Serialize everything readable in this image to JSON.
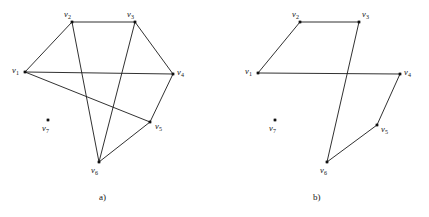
{
  "figure": {
    "background_color": "#ffffff",
    "ink_color": "#1a1a1a",
    "width": 429,
    "height": 217,
    "panels": [
      {
        "id": "panel-a",
        "caption": "a)",
        "caption_x": 99,
        "caption_y": 192,
        "vertices": [
          {
            "id": "v1",
            "label": "v",
            "sub": "1",
            "x": 25,
            "y": 72,
            "label_x": 12,
            "label_y": 66,
            "isolated": false
          },
          {
            "id": "v2",
            "label": "v",
            "sub": "2",
            "x": 72,
            "y": 22,
            "label_x": 64,
            "label_y": 10,
            "isolated": false
          },
          {
            "id": "v3",
            "label": "v",
            "sub": "3",
            "x": 135,
            "y": 22,
            "label_x": 127,
            "label_y": 10,
            "isolated": false
          },
          {
            "id": "v4",
            "label": "v",
            "sub": "4",
            "x": 173,
            "y": 74,
            "label_x": 177,
            "label_y": 68,
            "isolated": false
          },
          {
            "id": "v5",
            "label": "v",
            "sub": "5",
            "x": 150,
            "y": 122,
            "label_x": 155,
            "label_y": 122,
            "isolated": false
          },
          {
            "id": "v6",
            "label": "v",
            "sub": "6",
            "x": 99,
            "y": 162,
            "label_x": 91,
            "label_y": 166,
            "isolated": false
          },
          {
            "id": "v7",
            "label": "v",
            "sub": "7",
            "x": 48,
            "y": 120,
            "label_x": 42,
            "label_y": 124,
            "isolated": true
          }
        ],
        "edges": [
          [
            "v1",
            "v2"
          ],
          [
            "v1",
            "v4"
          ],
          [
            "v1",
            "v5"
          ],
          [
            "v2",
            "v3"
          ],
          [
            "v2",
            "v6"
          ],
          [
            "v3",
            "v4"
          ],
          [
            "v3",
            "v6"
          ],
          [
            "v4",
            "v5"
          ],
          [
            "v5",
            "v6"
          ]
        ]
      },
      {
        "id": "panel-b",
        "caption": "b)",
        "caption_x": 313,
        "caption_y": 192,
        "vertices": [
          {
            "id": "v1",
            "label": "v",
            "sub": "1",
            "x": 258,
            "y": 73,
            "label_x": 245,
            "label_y": 67,
            "isolated": false
          },
          {
            "id": "v2",
            "label": "v",
            "sub": "2",
            "x": 300,
            "y": 22,
            "label_x": 292,
            "label_y": 10,
            "isolated": false
          },
          {
            "id": "v3",
            "label": "v",
            "sub": "3",
            "x": 359,
            "y": 22,
            "label_x": 362,
            "label_y": 10,
            "isolated": false
          },
          {
            "id": "v4",
            "label": "v",
            "sub": "4",
            "x": 400,
            "y": 74,
            "label_x": 404,
            "label_y": 68,
            "isolated": false
          },
          {
            "id": "v5",
            "label": "v",
            "sub": "5",
            "x": 377,
            "y": 125,
            "label_x": 381,
            "label_y": 125,
            "isolated": false
          },
          {
            "id": "v6",
            "label": "v",
            "sub": "6",
            "x": 327,
            "y": 162,
            "label_x": 320,
            "label_y": 166,
            "isolated": false
          },
          {
            "id": "v7",
            "label": "v",
            "sub": "7",
            "x": 275,
            "y": 120,
            "label_x": 269,
            "label_y": 124,
            "isolated": true
          }
        ],
        "edges": [
          [
            "v1",
            "v2"
          ],
          [
            "v2",
            "v3"
          ],
          [
            "v3",
            "v6"
          ],
          [
            "v1",
            "v4"
          ],
          [
            "v4",
            "v5"
          ],
          [
            "v5",
            "v6"
          ]
        ]
      }
    ]
  }
}
